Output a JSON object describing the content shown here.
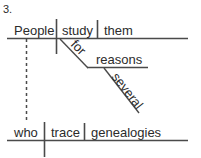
{
  "diagram": {
    "item_number": "3.",
    "type": "reed-kellogg-sentence-diagram",
    "ink_color": "#4a4a4a",
    "text_color": "#2b2b2b",
    "background_color": "#ffffff",
    "main_clause": {
      "subject": "People",
      "verb": "study",
      "direct_object": "them"
    },
    "prepositional_phrase": {
      "preposition": "for",
      "object": "reasons",
      "modifier": "several"
    },
    "relative_clause": {
      "subject": "who",
      "verb": "trace",
      "direct_object": "genealogies"
    }
  }
}
